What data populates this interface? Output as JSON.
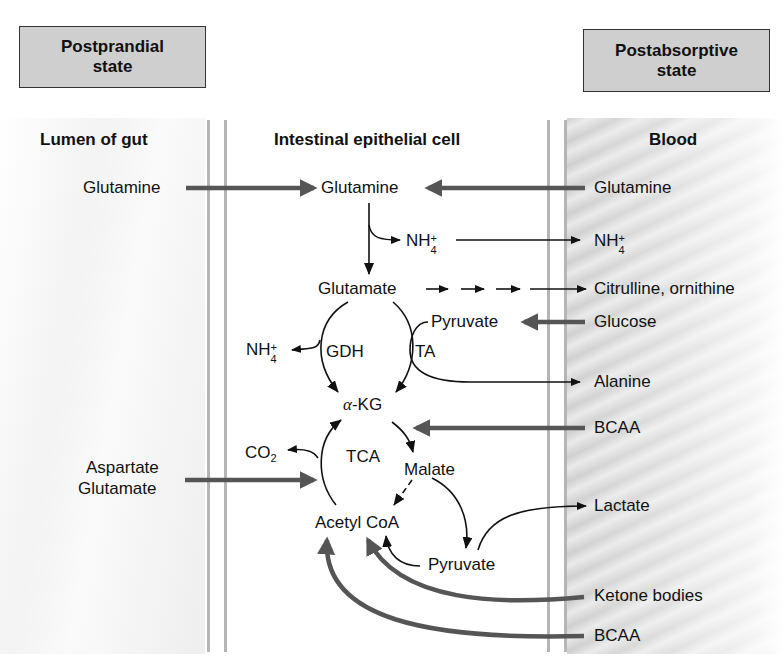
{
  "diagram": {
    "states": {
      "left": [
        "Postprandial",
        "state"
      ],
      "right": [
        "Postabsorptive",
        "state"
      ]
    },
    "compartments": {
      "lumen": "Lumen of gut",
      "cell": "Intestinal epithelial cell",
      "blood": "Blood"
    },
    "lumen_labels": {
      "glutamine": "Glutamine",
      "aspartate": "Aspartate",
      "glutamate": "Glutamate"
    },
    "cell_labels": {
      "glutamine": "Glutamine",
      "nh4_top": "NH",
      "glutamate": "Glutamate",
      "pyruvate_top": "Pyruvate",
      "nh4_left": "NH",
      "gdh": "GDH",
      "ta": "TA",
      "alpha": "α",
      "kg": "-KG",
      "co2": "CO",
      "co2_sub": "2",
      "tca": "TCA",
      "malate": "Malate",
      "acetyl_coa": "Acetyl CoA",
      "pyruvate_bottom": "Pyruvate"
    },
    "blood_labels": {
      "glutamine": "Glutamine",
      "nh4": "NH",
      "citrulline": "Citrulline, ornithine",
      "glucose": "Glucose",
      "alanine": "Alanine",
      "bcaa_top": "BCAA",
      "lactate": "Lactate",
      "ketone": "Ketone bodies",
      "bcaa_bottom": "BCAA"
    },
    "ion": {
      "charge": "+",
      "count": "4"
    },
    "colors": {
      "thick_arrow": "#555555",
      "thin_arrow": "#111111",
      "state_box_fill": "#cfcfcf"
    }
  }
}
